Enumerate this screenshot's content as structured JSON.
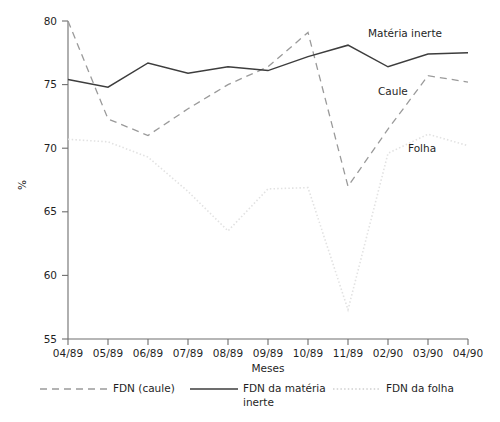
{
  "chart_data": {
    "type": "line",
    "title": "",
    "xlabel": "Meses",
    "ylabel": "%",
    "ylim": [
      55,
      80
    ],
    "xlim_categories": 11,
    "grid": false,
    "legend_position": "bottom",
    "categories": [
      "04/89",
      "05/89",
      "06/89",
      "07/89",
      "08/89",
      "09/89",
      "10/89",
      "11/89",
      "02/90",
      "03/90",
      "04/90"
    ],
    "yticks": [
      55,
      60,
      65,
      70,
      75,
      80
    ],
    "series": [
      {
        "name": "FDN (caule)",
        "annotation": "Caule",
        "style": "dashed",
        "color": "#9a9a9a",
        "values": [
          80.0,
          72.3,
          71.0,
          73.1,
          75.0,
          76.4,
          79.1,
          67.0,
          71.5,
          75.7,
          75.2
        ]
      },
      {
        "name": "FDN da matéria inerte",
        "annotation": "Matéria inerte",
        "style": "solid",
        "color": "#3d3d3d",
        "values": [
          75.4,
          74.8,
          76.7,
          75.9,
          76.4,
          76.1,
          77.2,
          78.1,
          76.4,
          77.4,
          77.5
        ]
      },
      {
        "name": "FDN da folha",
        "annotation": "Folha",
        "style": "dotted",
        "color": "#e2e2e2",
        "values": [
          70.7,
          70.5,
          69.3,
          66.6,
          63.5,
          66.8,
          66.9,
          57.3,
          69.6,
          71.1,
          70.2
        ]
      }
    ]
  },
  "annotations": [
    {
      "label": "Matéria inerte",
      "x": 368,
      "y": 37
    },
    {
      "label": "Caule",
      "x": 378,
      "y": 95
    },
    {
      "label": "Folha",
      "x": 408,
      "y": 152
    }
  ],
  "legend": {
    "items": [
      {
        "label": "FDN (caule)",
        "style": "dashed",
        "color": "#9a9a9a"
      },
      {
        "label": "FDN da matéria",
        "label2": "inerte",
        "style": "solid",
        "color": "#3d3d3d"
      },
      {
        "label": "FDN da folha",
        "style": "dotted",
        "color": "#d0d0d0"
      }
    ]
  },
  "axes": {
    "y_axis_title": "%",
    "x_axis_title": "Meses"
  }
}
